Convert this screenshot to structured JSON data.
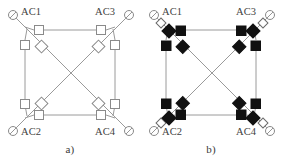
{
  "figure": {
    "panels": [
      {
        "id": "a",
        "caption": "a)",
        "switch_state": "open",
        "nodes": [
          {
            "id": "AC1",
            "label": "AC1",
            "corner": "top-left"
          },
          {
            "id": "AC3",
            "label": "AC3",
            "corner": "top-right"
          },
          {
            "id": "AC2",
            "label": "AC2",
            "corner": "bottom-left"
          },
          {
            "id": "AC4",
            "label": "AC4",
            "corner": "bottom-right"
          }
        ],
        "source_symbol": "ac-source-circle",
        "orthogonal_switch_symbol": "open-square",
        "diagonal_switch_symbol": "open-diamond",
        "orthogonal_switch_count": 8,
        "diagonal_switch_count": 4,
        "edges": [
          "AC1-AC3",
          "AC2-AC4",
          "AC1-AC2",
          "AC3-AC4",
          "AC1-AC4",
          "AC2-AC3"
        ]
      },
      {
        "id": "b",
        "caption": "b)",
        "switch_state": "closed",
        "nodes": [
          {
            "id": "AC1",
            "label": "AC1",
            "corner": "top-left"
          },
          {
            "id": "AC3",
            "label": "AC3",
            "corner": "top-right"
          },
          {
            "id": "AC2",
            "label": "AC2",
            "corner": "bottom-left"
          },
          {
            "id": "AC4",
            "label": "AC4",
            "corner": "bottom-right"
          }
        ],
        "source_symbol": "ac-source-circle",
        "orthogonal_switch_symbol": "filled-square",
        "diagonal_switch_symbol": "filled-diamond",
        "orthogonal_switch_count": 8,
        "diagonal_switch_count": 4,
        "edges": [
          "AC1-AC3",
          "AC2-AC4",
          "AC1-AC2",
          "AC3-AC4",
          "AC1-AC4",
          "AC2-AC3"
        ]
      }
    ],
    "colors": {
      "line": "#9a9a9a",
      "open_fill": "#ffffff",
      "open_stroke": "#8a8a8a",
      "closed_fill": "#111111",
      "closed_stroke": "#111111",
      "text": "#3f3f3f",
      "background": "#ffffff"
    }
  }
}
